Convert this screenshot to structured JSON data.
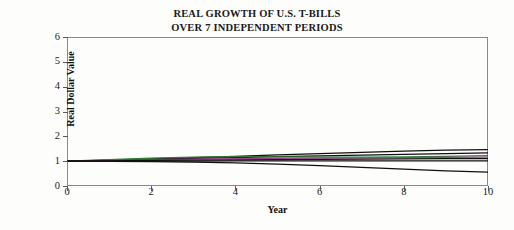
{
  "chart_data": {
    "type": "line",
    "title": "REAL GROWTH OF U.S. T-BILLS OVER 7 INDEPENDENT PERIODS",
    "title_line1": "REAL GROWTH OF U.S. T-BILLS",
    "title_line2": "OVER 7 INDEPENDENT PERIODS",
    "xlabel": "Year",
    "ylabel": "Real Dollar Value",
    "xlim": [
      0,
      10
    ],
    "ylim": [
      0,
      6
    ],
    "xticks": [
      0,
      2,
      4,
      6,
      8,
      10
    ],
    "xtick_labels": [
      "0",
      "2",
      "4",
      "6",
      "8",
      "10"
    ],
    "yticks": [
      0,
      1,
      2,
      3,
      4,
      5,
      6
    ],
    "ytick_labels": [
      "0",
      "1",
      "2",
      "3",
      "4",
      "5",
      "6"
    ],
    "grid": false,
    "legend": "none",
    "x": [
      0,
      1,
      2,
      3,
      4,
      5,
      6,
      7,
      8,
      9,
      10
    ],
    "series": [
      {
        "name": "period-1",
        "color": "#101010",
        "values": [
          1.0,
          1.04,
          1.09,
          1.14,
          1.19,
          1.25,
          1.3,
          1.35,
          1.4,
          1.44,
          1.47
        ]
      },
      {
        "name": "period-2",
        "color": "#101010",
        "values": [
          1.0,
          1.03,
          1.07,
          1.11,
          1.14,
          1.18,
          1.21,
          1.24,
          1.27,
          1.3,
          1.33
        ]
      },
      {
        "name": "period-3",
        "color": "#2f7d32",
        "values": [
          1.0,
          1.06,
          1.12,
          1.16,
          1.18,
          1.17,
          1.16,
          1.16,
          1.17,
          1.19,
          1.22
        ]
      },
      {
        "name": "period-4",
        "color": "#9c3d8e",
        "values": [
          1.0,
          1.03,
          1.06,
          1.08,
          1.1,
          1.11,
          1.12,
          1.13,
          1.14,
          1.15,
          1.16
        ]
      },
      {
        "name": "period-5",
        "color": "#101010",
        "values": [
          1.0,
          1.01,
          1.03,
          1.04,
          1.05,
          1.06,
          1.07,
          1.08,
          1.09,
          1.1,
          1.1
        ]
      },
      {
        "name": "period-6",
        "color": "#101010",
        "values": [
          1.0,
          1.0,
          1.0,
          1.0,
          1.01,
          1.01,
          1.01,
          1.01,
          1.01,
          1.01,
          1.01
        ]
      },
      {
        "name": "period-7",
        "color": "#101010",
        "values": [
          1.0,
          0.99,
          0.98,
          0.96,
          0.93,
          0.88,
          0.82,
          0.75,
          0.68,
          0.61,
          0.56
        ]
      }
    ]
  }
}
